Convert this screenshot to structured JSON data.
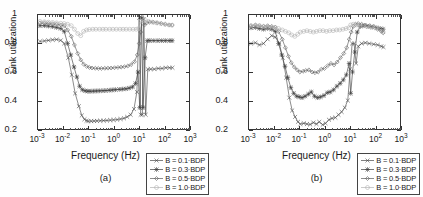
{
  "figure": {
    "panels": [
      {
        "id": "a",
        "caption": "(a)",
        "xlabel": "Frequency (Hz)",
        "ylabel": "Link utilization"
      },
      {
        "id": "b",
        "caption": "(b)",
        "xlabel": "Frequency (Hz)",
        "ylabel": "Link utilization"
      }
    ],
    "legend_labels": [
      "B = 0.1·BDP",
      "B = 0.3·BDP",
      "B = 0.5·BDP",
      "B = 1.0·BDP"
    ],
    "ytick_labels": [
      "1",
      "0.8",
      "0.6",
      "0.4",
      "0.2"
    ],
    "xtick_labels": [
      "10-3",
      "10-2",
      "10-1",
      "100",
      "101",
      "102",
      "103"
    ],
    "xtick_bases": [
      "10",
      "10",
      "10",
      "10",
      "10",
      "10",
      "10"
    ],
    "xtick_exps": [
      "-3",
      "-2",
      "-1",
      "0",
      "1",
      "2",
      "3"
    ]
  },
  "chart_data": [
    {
      "type": "line",
      "panel": "a",
      "title": "",
      "xlabel": "Frequency (Hz)",
      "ylabel": "Link utilization",
      "xscale": "log",
      "xlim": [
        0.001,
        1000
      ],
      "ylim": [
        0.2,
        1.0
      ],
      "yticks": [
        0.2,
        0.4,
        0.6,
        0.8,
        1.0
      ],
      "xticks": [
        0.001,
        0.01,
        0.1,
        1,
        10,
        100,
        1000
      ],
      "grid": false,
      "legend_position": "lower-right",
      "series": [
        {
          "name": "B = 0.1·BDP",
          "marker": "x",
          "color": "#4a4a4a",
          "x": [
            0.0012,
            0.0018,
            0.0026,
            0.0038,
            0.0055,
            0.008,
            0.011,
            0.016,
            0.022,
            0.03,
            0.042,
            0.055,
            0.07,
            0.085,
            0.1,
            0.13,
            0.17,
            0.22,
            0.3,
            0.4,
            0.55,
            0.75,
            1.0,
            1.4,
            1.9,
            2.6,
            3.5,
            4.8,
            6.5,
            8.5,
            10.5,
            12,
            14,
            16,
            19,
            23,
            30,
            42,
            60,
            85,
            120,
            170,
            220
          ],
          "y": [
            0.815,
            0.818,
            0.822,
            0.826,
            0.828,
            0.822,
            0.8,
            0.7,
            0.58,
            0.45,
            0.36,
            0.295,
            0.268,
            0.258,
            0.255,
            0.255,
            0.256,
            0.257,
            0.258,
            0.259,
            0.26,
            0.262,
            0.264,
            0.266,
            0.27,
            0.275,
            0.285,
            0.3,
            0.34,
            0.46,
            0.98,
            0.3,
            0.3,
            0.97,
            0.3,
            0.62,
            0.62,
            0.62,
            0.625,
            0.625,
            0.63,
            0.63,
            0.63
          ]
        },
        {
          "name": "B = 0.3·BDP",
          "marker": "asterisk",
          "color": "#3d3d3d",
          "x": [
            0.0012,
            0.0018,
            0.0026,
            0.0038,
            0.0055,
            0.008,
            0.011,
            0.015,
            0.02,
            0.027,
            0.035,
            0.045,
            0.058,
            0.075,
            0.095,
            0.12,
            0.16,
            0.21,
            0.28,
            0.38,
            0.5,
            0.68,
            0.9,
            1.2,
            1.7,
            2.3,
            3.1,
            4.2,
            5.7,
            7.5,
            9.5,
            11,
            13,
            15,
            18,
            22,
            28,
            40,
            58,
            82,
            115,
            165,
            215
          ],
          "y": [
            0.925,
            0.925,
            0.922,
            0.918,
            0.912,
            0.905,
            0.885,
            0.8,
            0.72,
            0.635,
            0.565,
            0.5,
            0.475,
            0.468,
            0.465,
            0.465,
            0.466,
            0.467,
            0.468,
            0.469,
            0.47,
            0.472,
            0.474,
            0.476,
            0.478,
            0.48,
            0.482,
            0.487,
            0.495,
            0.52,
            0.6,
            0.35,
            0.98,
            0.35,
            0.7,
            0.82,
            0.82,
            0.82,
            0.82,
            0.82,
            0.82,
            0.82,
            0.82
          ]
        },
        {
          "name": "B = 0.5·BDP",
          "marker": "diamond",
          "color": "#5a5a5a",
          "x": [
            0.0012,
            0.0018,
            0.0026,
            0.0038,
            0.0055,
            0.008,
            0.011,
            0.015,
            0.021,
            0.028,
            0.038,
            0.05,
            0.065,
            0.085,
            0.11,
            0.14,
            0.19,
            0.25,
            0.33,
            0.45,
            0.6,
            0.8,
            1.1,
            1.5,
            2.0,
            2.7,
            3.7,
            5.0,
            6.8,
            8.8,
            10.5,
            12,
            14,
            17,
            21,
            27,
            38,
            55,
            80,
            115,
            165,
            215
          ],
          "y": [
            0.945,
            0.943,
            0.94,
            0.938,
            0.935,
            0.93,
            0.925,
            0.895,
            0.85,
            0.79,
            0.73,
            0.685,
            0.655,
            0.64,
            0.632,
            0.628,
            0.626,
            0.625,
            0.625,
            0.626,
            0.627,
            0.628,
            0.63,
            0.632,
            0.634,
            0.637,
            0.642,
            0.652,
            0.672,
            0.72,
            0.8,
            0.88,
            0.985,
            0.93,
            0.945,
            0.95,
            0.95,
            0.945,
            0.94,
            0.935,
            0.93,
            0.93
          ]
        },
        {
          "name": "B = 1.0·BDP",
          "marker": "circle",
          "color": "#b5b5b5",
          "x": [
            0.0012,
            0.0018,
            0.0026,
            0.0038,
            0.0055,
            0.008,
            0.011,
            0.015,
            0.021,
            0.028,
            0.038,
            0.05,
            0.065,
            0.085,
            0.11,
            0.15,
            0.2,
            0.28,
            0.38,
            0.5,
            0.7,
            0.95,
            1.3,
            1.8,
            2.4,
            3.2,
            4.4,
            6.0,
            8.0,
            10.0,
            12,
            15,
            19,
            25,
            35,
            50,
            75,
            110,
            160,
            210
          ],
          "y": [
            0.955,
            0.952,
            0.95,
            0.948,
            0.945,
            0.942,
            0.94,
            0.935,
            0.925,
            0.9,
            0.87,
            0.855,
            0.885,
            0.895,
            0.898,
            0.9,
            0.9,
            0.9,
            0.9,
            0.9,
            0.9,
            0.9,
            0.9,
            0.9,
            0.9,
            0.9,
            0.9,
            0.9,
            0.9,
            0.905,
            0.955,
            0.96,
            0.96,
            0.955,
            0.95,
            0.945,
            0.94,
            0.935,
            0.93,
            0.928
          ]
        }
      ]
    },
    {
      "type": "line",
      "panel": "b",
      "title": "",
      "xlabel": "Frequency (Hz)",
      "ylabel": "Link utilization",
      "xscale": "log",
      "xlim": [
        0.001,
        1000
      ],
      "ylim": [
        0.2,
        1.0
      ],
      "yticks": [
        0.2,
        0.4,
        0.6,
        0.8,
        1.0
      ],
      "xticks": [
        0.001,
        0.01,
        0.1,
        1,
        10,
        100,
        1000
      ],
      "grid": false,
      "legend_position": "lower-right",
      "series": [
        {
          "name": "B = 0.1·BDP",
          "marker": "x",
          "color": "#4a4a4a",
          "x": [
            0.0012,
            0.0018,
            0.0026,
            0.0038,
            0.0055,
            0.008,
            0.011,
            0.016,
            0.022,
            0.03,
            0.04,
            0.052,
            0.068,
            0.088,
            0.11,
            0.15,
            0.2,
            0.27,
            0.36,
            0.48,
            0.62,
            0.85,
            1.1,
            1.5,
            2.0,
            2.7,
            3.6,
            4.8,
            6.4,
            8.4,
            10.5,
            12.5,
            15,
            18,
            22,
            30,
            42,
            60,
            90,
            130,
            180,
            220
          ],
          "y": [
            0.8,
            0.805,
            0.79,
            0.8,
            0.83,
            0.855,
            0.845,
            0.8,
            0.7,
            0.56,
            0.42,
            0.33,
            0.285,
            0.25,
            0.235,
            0.24,
            0.235,
            0.232,
            0.245,
            0.235,
            0.25,
            0.23,
            0.24,
            0.265,
            0.275,
            0.28,
            0.3,
            0.32,
            0.35,
            0.4,
            0.62,
            0.8,
            0.8,
            0.66,
            0.78,
            0.8,
            0.805,
            0.8,
            0.795,
            0.79,
            0.78,
            0.775
          ]
        },
        {
          "name": "B = 0.3·BDP",
          "marker": "asterisk",
          "color": "#3d3d3d",
          "x": [
            0.0012,
            0.0018,
            0.0026,
            0.0038,
            0.0055,
            0.008,
            0.011,
            0.015,
            0.02,
            0.027,
            0.035,
            0.046,
            0.06,
            0.078,
            0.1,
            0.13,
            0.17,
            0.23,
            0.3,
            0.4,
            0.53,
            0.7,
            0.95,
            1.3,
            1.7,
            2.3,
            3.1,
            4.2,
            5.6,
            7.4,
            9.5,
            11,
            13,
            16,
            20,
            27,
            38,
            55,
            80,
            120,
            170,
            215
          ],
          "y": [
            0.91,
            0.912,
            0.905,
            0.9,
            0.905,
            0.9,
            0.885,
            0.8,
            0.72,
            0.64,
            0.56,
            0.49,
            0.45,
            0.43,
            0.425,
            0.42,
            0.43,
            0.445,
            0.46,
            0.43,
            0.42,
            0.425,
            0.435,
            0.455,
            0.46,
            0.475,
            0.5,
            0.52,
            0.545,
            0.58,
            0.66,
            0.45,
            0.6,
            0.74,
            0.88,
            0.92,
            0.925,
            0.92,
            0.915,
            0.91,
            0.905,
            0.9
          ]
        },
        {
          "name": "B = 0.5·BDP",
          "marker": "diamond",
          "color": "#5a5a5a",
          "x": [
            0.0012,
            0.0018,
            0.0026,
            0.0038,
            0.0055,
            0.008,
            0.011,
            0.015,
            0.021,
            0.028,
            0.037,
            0.048,
            0.063,
            0.082,
            0.105,
            0.14,
            0.18,
            0.24,
            0.32,
            0.42,
            0.56,
            0.75,
            1.0,
            1.35,
            1.8,
            2.4,
            3.2,
            4.3,
            5.8,
            7.6,
            9.6,
            11.5,
            14,
            17,
            22,
            30,
            42,
            62,
            90,
            130,
            180,
            215
          ],
          "y": [
            0.925,
            0.93,
            0.925,
            0.92,
            0.925,
            0.92,
            0.915,
            0.885,
            0.83,
            0.77,
            0.71,
            0.665,
            0.635,
            0.615,
            0.6,
            0.605,
            0.61,
            0.615,
            0.6,
            0.595,
            0.6,
            0.62,
            0.625,
            0.645,
            0.66,
            0.65,
            0.67,
            0.7,
            0.73,
            0.77,
            0.83,
            0.88,
            0.92,
            0.935,
            0.94,
            0.935,
            0.93,
            0.925,
            0.92,
            0.9,
            0.885,
            0.875
          ]
        },
        {
          "name": "B = 1.0·BDP",
          "marker": "circle",
          "color": "#b5b5b5",
          "x": [
            0.0012,
            0.0018,
            0.0026,
            0.0038,
            0.0055,
            0.008,
            0.011,
            0.015,
            0.021,
            0.028,
            0.038,
            0.05,
            0.066,
            0.086,
            0.11,
            0.15,
            0.2,
            0.27,
            0.36,
            0.48,
            0.65,
            0.88,
            1.2,
            1.6,
            2.2,
            3.0,
            4.0,
            5.4,
            7.2,
            9.2,
            11,
            14,
            18,
            24,
            34,
            48,
            70,
            105,
            150,
            205
          ],
          "y": [
            0.925,
            0.928,
            0.925,
            0.92,
            0.918,
            0.915,
            0.912,
            0.905,
            0.895,
            0.885,
            0.875,
            0.86,
            0.85,
            0.865,
            0.88,
            0.885,
            0.89,
            0.885,
            0.88,
            0.885,
            0.89,
            0.89,
            0.885,
            0.89,
            0.89,
            0.895,
            0.895,
            0.9,
            0.905,
            0.91,
            0.93,
            0.935,
            0.93,
            0.925,
            0.925,
            0.92,
            0.915,
            0.91,
            0.905,
            0.885
          ]
        }
      ]
    }
  ]
}
